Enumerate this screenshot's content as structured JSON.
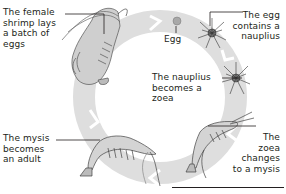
{
  "diagram": {
    "title_hidden": "",
    "type": "life-cycle",
    "subject": "shrimp",
    "ring_color": "#dcdcdc",
    "ring_arrow_color": "#e8e8e8",
    "text_color": "#231f20",
    "stages": [
      {
        "id": "adult-lays-eggs",
        "label": "The female\nshrimp lays\na batch of\neggs"
      },
      {
        "id": "egg",
        "label": "Egg"
      },
      {
        "id": "egg-contains-nauplius",
        "label": "The egg\ncontains a\nnauplius"
      },
      {
        "id": "nauplius-to-zoea",
        "label": "The nauplius\nbecomes a\nzoea"
      },
      {
        "id": "zoea-to-mysis",
        "label": "The\nzoea\nchanges\nto a mysis"
      },
      {
        "id": "mysis-to-adult",
        "label": "The mysis\nbecomes\nan adult"
      }
    ]
  }
}
